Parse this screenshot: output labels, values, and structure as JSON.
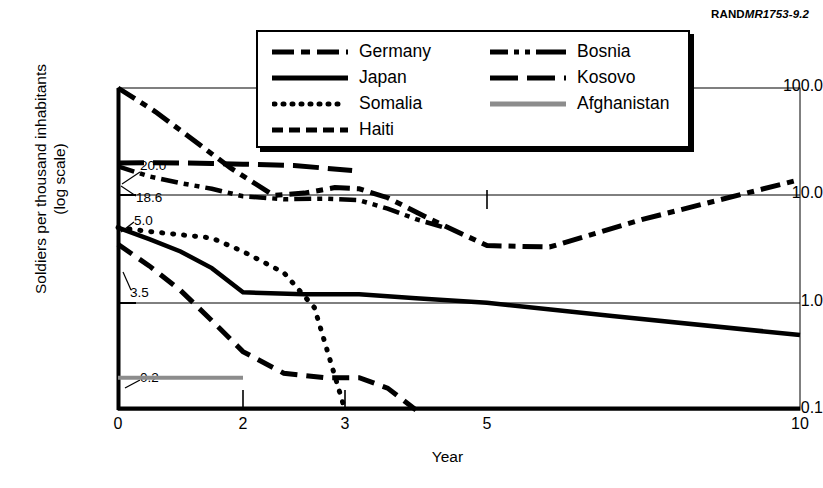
{
  "figure": {
    "id_prefix": "RAND",
    "id_number": "MR1753-9.2"
  },
  "axes": {
    "ylabel_line1": "Soldiers per thousand inhabitants",
    "ylabel_line2": "(log scale)",
    "xlabel": "Year",
    "yticks": [
      "100.0",
      "10.0",
      "1.0",
      "0.1"
    ],
    "xticks": [
      "0",
      "2",
      "3",
      "5",
      "10"
    ]
  },
  "annotations": [
    {
      "text": "20.0",
      "series": "Kosovo"
    },
    {
      "text": "18.6",
      "series": "Bosnia"
    },
    {
      "text": "5.0",
      "series": "Somalia"
    },
    {
      "text": "3.5",
      "series": "Haiti"
    },
    {
      "text": "0.2",
      "series": "Afghanistan"
    }
  ],
  "legend": {
    "left_column": [
      {
        "label": "Germany",
        "style": "dash-dot"
      },
      {
        "label": "Japan",
        "style": "solid"
      },
      {
        "label": "Somalia",
        "style": "dotted"
      },
      {
        "label": "Haiti",
        "style": "dashed"
      }
    ],
    "right_column": [
      {
        "label": "Bosnia",
        "style": "dash-dot-dot"
      },
      {
        "label": "Kosovo",
        "style": "long-dash"
      },
      {
        "label": "Afghanistan",
        "style": "solid-gray"
      }
    ]
  },
  "colors": {
    "line": "#000000",
    "afghanistan": "#8c8c8c",
    "axis": "#000000",
    "gridline": "#000000",
    "background": "#ffffff"
  },
  "chart_data": {
    "type": "line",
    "title": "",
    "xlabel": "Year",
    "ylabel": "Soldiers per thousand inhabitants (log scale)",
    "yscale": "log",
    "ylim": [
      0.1,
      100.0
    ],
    "xlim": [
      0,
      10
    ],
    "xticks": [
      0,
      2,
      3,
      5,
      10
    ],
    "yticks": [
      0.1,
      1.0,
      10.0,
      100.0
    ],
    "grid": true,
    "legend_position": "top-center",
    "start_values": {
      "Germany": 100.0,
      "Kosovo": 20.0,
      "Bosnia": 18.6,
      "Somalia": 5.0,
      "Japan": 5.0,
      "Haiti": 3.5,
      "Afghanistan": 0.2
    },
    "series": [
      {
        "name": "Germany",
        "style": "dash-dot",
        "x": [
          0,
          0.6,
          1.2,
          1.8,
          2.3,
          2.6,
          2.9,
          3.2,
          3.6,
          4.2,
          5.0,
          6.0,
          7.5,
          10.0
        ],
        "y": [
          100.0,
          60.0,
          33.0,
          18.0,
          10.0,
          10.5,
          11.8,
          11.5,
          9.5,
          6.0,
          3.4,
          3.3,
          6.0,
          14.0
        ]
      },
      {
        "name": "Kosovo",
        "style": "long-dash",
        "x": [
          0,
          0.5,
          1.0,
          1.5,
          2.0,
          2.5,
          3.1
        ],
        "y": [
          20.0,
          20.2,
          20.0,
          19.8,
          19.5,
          19.0,
          17.0
        ]
      },
      {
        "name": "Bosnia",
        "style": "dash-dot-dot",
        "x": [
          0,
          0.5,
          1.0,
          1.5,
          2.0,
          2.4,
          2.8,
          3.2,
          3.6,
          4.0,
          4.4
        ],
        "y": [
          18.6,
          15.0,
          13.0,
          11.5,
          9.8,
          9.2,
          9.3,
          9.0,
          7.5,
          6.0,
          5.0
        ]
      },
      {
        "name": "Japan",
        "style": "solid",
        "x": [
          0,
          0.5,
          1.0,
          1.5,
          2.0,
          2.6,
          3.2,
          4.0,
          5.0,
          7.0,
          10.0
        ],
        "y": [
          5.0,
          3.9,
          3.0,
          2.1,
          1.25,
          1.2,
          1.2,
          1.1,
          1.0,
          0.75,
          0.5
        ]
      },
      {
        "name": "Somalia",
        "style": "dotted",
        "x": [
          0,
          0.5,
          1.0,
          1.5,
          2.0,
          2.4,
          2.7,
          3.0
        ],
        "y": [
          5.0,
          4.6,
          4.3,
          4.0,
          3.0,
          1.9,
          0.9,
          0.1
        ]
      },
      {
        "name": "Haiti",
        "style": "dashed",
        "x": [
          0,
          0.5,
          1.0,
          1.5,
          2.0,
          2.4,
          2.8,
          3.2,
          3.6,
          4.0
        ],
        "y": [
          3.5,
          2.2,
          1.3,
          0.68,
          0.35,
          0.22,
          0.2,
          0.2,
          0.16,
          0.1
        ]
      },
      {
        "name": "Afghanistan",
        "style": "solid-gray",
        "x": [
          0,
          2.0
        ],
        "y": [
          0.2,
          0.2
        ]
      }
    ]
  }
}
